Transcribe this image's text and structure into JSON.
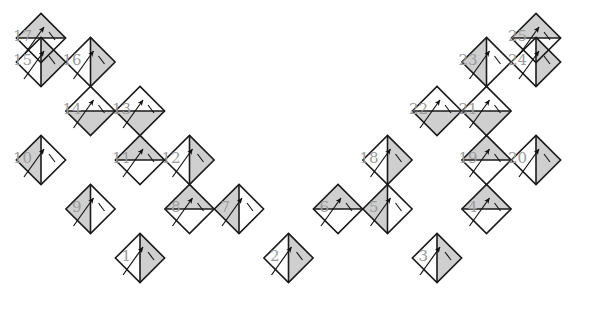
{
  "figure": {
    "name": "zigzag-diamond-tiling",
    "colors": {
      "shade": "#cfcfcf",
      "stroke": "#1a1a1a",
      "label": "#9b9b9b",
      "arrow": "#111111",
      "background": "#ffffff"
    },
    "geometry": {
      "half": 24.6,
      "origin_x": 17.5,
      "origin_y": 13.5,
      "label_offset_x": -9,
      "label_offset_y": -1
    },
    "caption": "",
    "cells": [
      {
        "id": 1,
        "label": "1",
        "cx": 140.0,
        "cy": 258.0,
        "shaded": "right",
        "arrow": "up-right"
      },
      {
        "id": 2,
        "label": "2",
        "cx": 288.5,
        "cy": 258.0,
        "shaded": "right",
        "arrow": "up-right"
      },
      {
        "id": 3,
        "label": "3",
        "cx": 437.0,
        "cy": 258.0,
        "shaded": "right",
        "arrow": "up-right"
      },
      {
        "id": 4,
        "label": "4",
        "cx": 486.5,
        "cy": 209.0,
        "shaded": "top",
        "arrow": "up-right"
      },
      {
        "id": 5,
        "label": "5",
        "cx": 387.5,
        "cy": 209.0,
        "shaded": "left",
        "arrow": "up-right"
      },
      {
        "id": 6,
        "label": "6",
        "cx": 338.0,
        "cy": 209.0,
        "shaded": "top",
        "arrow": "up-right"
      },
      {
        "id": 7,
        "label": "7",
        "cx": 239.0,
        "cy": 209.0,
        "shaded": "left",
        "arrow": "up-right"
      },
      {
        "id": 8,
        "label": "8",
        "cx": 189.5,
        "cy": 209.0,
        "shaded": "top",
        "arrow": "up-right"
      },
      {
        "id": 9,
        "label": "9",
        "cx": 90.5,
        "cy": 209.0,
        "shaded": "left",
        "arrow": "up-right"
      },
      {
        "id": 10,
        "label": "10",
        "cx": 41.0,
        "cy": 160.0,
        "shaded": "left",
        "arrow": "up-right"
      },
      {
        "id": 11,
        "label": "11",
        "cx": 140.0,
        "cy": 160.0,
        "shaded": "top",
        "arrow": "up-right"
      },
      {
        "id": 12,
        "label": "12",
        "cx": 189.5,
        "cy": 160.0,
        "shaded": "right",
        "arrow": "up-right"
      },
      {
        "id": 13,
        "label": "13",
        "cx": 140.0,
        "cy": 111.0,
        "shaded": "bottom",
        "arrow": "up-right"
      },
      {
        "id": 14,
        "label": "14",
        "cx": 90.5,
        "cy": 111.0,
        "shaded": "bottom",
        "arrow": "up-right"
      },
      {
        "id": 15,
        "label": "15",
        "cx": 41.0,
        "cy": 62.0,
        "shaded": "right",
        "arrow": "up-right"
      },
      {
        "id": 16,
        "label": "16",
        "cx": 90.5,
        "cy": 62.0,
        "shaded": "right",
        "arrow": "up-right"
      },
      {
        "id": 17,
        "label": "17",
        "cx": 41.0,
        "cy": 38.0,
        "shaded": "top",
        "arrow": "up-right"
      },
      {
        "id": 18,
        "label": "18",
        "cx": 387.5,
        "cy": 160.0,
        "shaded": "right",
        "arrow": "up-right"
      },
      {
        "id": 19,
        "label": "19",
        "cx": 486.5,
        "cy": 160.0,
        "shaded": "top",
        "arrow": "up-right"
      },
      {
        "id": 20,
        "label": "20",
        "cx": 536.0,
        "cy": 160.0,
        "shaded": "right",
        "arrow": "up-right"
      },
      {
        "id": 21,
        "label": "21",
        "cx": 486.5,
        "cy": 111.0,
        "shaded": "bottom",
        "arrow": "up-right"
      },
      {
        "id": 22,
        "label": "22",
        "cx": 437.0,
        "cy": 111.0,
        "shaded": "bottom",
        "arrow": "up-right"
      },
      {
        "id": 23,
        "label": "23",
        "cx": 486.5,
        "cy": 62.0,
        "shaded": "left",
        "arrow": "up-right"
      },
      {
        "id": 24,
        "label": "24",
        "cx": 536.0,
        "cy": 62.0,
        "shaded": "right",
        "arrow": "up-right"
      },
      {
        "id": 25,
        "label": "25",
        "cx": 536.0,
        "cy": 38.0,
        "shaded": "top",
        "arrow": "up-right"
      }
    ]
  }
}
